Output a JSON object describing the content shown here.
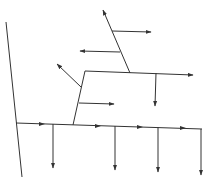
{
  "diagram": {
    "title": "",
    "stroke_color": "#333333",
    "background": "#ffffff",
    "lines": [
      {
        "id": "left-axis",
        "x1": 6,
        "y1": 22,
        "x2": 22,
        "y2": 177,
        "arrow": false
      },
      {
        "id": "main-horizontal",
        "x1": 16,
        "y1": 123,
        "x2": 202,
        "y2": 129,
        "arrow": false
      },
      {
        "id": "mid-slanted",
        "x1": 73,
        "y1": 125,
        "x2": 85,
        "y2": 71,
        "arrow": false
      },
      {
        "id": "upper-horizontal",
        "x1": 85,
        "y1": 71,
        "x2": 193,
        "y2": 75,
        "arrow": true
      },
      {
        "id": "top-slanted",
        "x1": 130,
        "y1": 73,
        "x2": 103,
        "y2": 10,
        "arrow": true
      },
      {
        "id": "top-right-branch",
        "x1": 112,
        "y1": 31,
        "x2": 151,
        "y2": 32,
        "arrow": true
      },
      {
        "id": "top-left-branch",
        "x1": 120,
        "y1": 52,
        "x2": 80,
        "y2": 51,
        "arrow": true
      },
      {
        "id": "mid-nw-branch",
        "x1": 81,
        "y1": 87,
        "x2": 57,
        "y2": 64,
        "arrow": true
      },
      {
        "id": "mid-right-branch",
        "x1": 79,
        "y1": 103,
        "x2": 114,
        "y2": 104,
        "arrow": true
      },
      {
        "id": "upper-down-branch",
        "x1": 156,
        "y1": 73,
        "x2": 155,
        "y2": 106,
        "arrow": true
      },
      {
        "id": "down-branch-1",
        "x1": 53,
        "y1": 124,
        "x2": 53,
        "y2": 168,
        "arrow": true
      },
      {
        "id": "down-branch-2",
        "x1": 115,
        "y1": 126,
        "x2": 115,
        "y2": 170,
        "arrow": true
      },
      {
        "id": "down-branch-3",
        "x1": 158,
        "y1": 127,
        "x2": 158,
        "y2": 172,
        "arrow": true
      },
      {
        "id": "down-branch-4",
        "x1": 201,
        "y1": 129,
        "x2": 201,
        "y2": 175,
        "arrow": true
      }
    ],
    "mid_arrows": [
      {
        "id": "flow-arrow-1",
        "x": 44,
        "y": 124
      },
      {
        "id": "flow-arrow-2",
        "x": 100,
        "y": 126
      },
      {
        "id": "flow-arrow-3",
        "x": 142,
        "y": 127
      },
      {
        "id": "flow-arrow-4",
        "x": 185,
        "y": 128
      }
    ]
  }
}
